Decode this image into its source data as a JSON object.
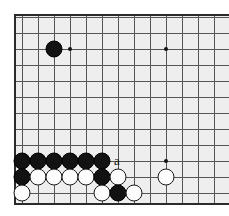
{
  "diagram": {
    "kind": "go-board-diagram",
    "board": {
      "background_color": "#eeeeee",
      "page_color": "#ffffff",
      "grid_line_color": "#555555",
      "edge_line_color": "#2b2b2b",
      "origin_x": 22,
      "origin_y": 17,
      "spacing": 16,
      "left_edge_x": 14,
      "top_edge_y": 14,
      "bottom_edge_y": 203,
      "cols_visible": 13,
      "rows_visible": 12,
      "grid_v_count": 13,
      "grid_h_count": 12
    },
    "star_points": [
      {
        "name": "star-point-upper-left",
        "col": 3,
        "row": 2
      },
      {
        "name": "star-point-upper-right",
        "col": 9,
        "row": 2
      },
      {
        "name": "star-point-lower-right",
        "col": 9,
        "row": 9
      }
    ],
    "stones": [
      {
        "color": "black",
        "col": 2,
        "row": 2
      },
      {
        "color": "black",
        "col": 0,
        "row": 9
      },
      {
        "color": "black",
        "col": 1,
        "row": 9
      },
      {
        "color": "black",
        "col": 2,
        "row": 9
      },
      {
        "color": "black",
        "col": 3,
        "row": 9
      },
      {
        "color": "black",
        "col": 4,
        "row": 9
      },
      {
        "color": "black",
        "col": 5,
        "row": 9
      },
      {
        "color": "black",
        "col": 0,
        "row": 10
      },
      {
        "color": "white",
        "col": 1,
        "row": 10
      },
      {
        "color": "white",
        "col": 2,
        "row": 10
      },
      {
        "color": "white",
        "col": 3,
        "row": 10
      },
      {
        "color": "white",
        "col": 4,
        "row": 10
      },
      {
        "color": "black",
        "col": 5,
        "row": 10
      },
      {
        "color": "white",
        "col": 6,
        "row": 10
      },
      {
        "color": "white",
        "col": 9,
        "row": 10
      },
      {
        "color": "white",
        "col": 0,
        "row": 11
      },
      {
        "color": "white",
        "col": 5,
        "row": 11
      },
      {
        "color": "black",
        "col": 6,
        "row": 11
      },
      {
        "color": "white",
        "col": 7,
        "row": 11
      }
    ],
    "labels": [
      {
        "text": "a",
        "col": 6,
        "row": 9,
        "name": "point-label-a"
      }
    ]
  }
}
